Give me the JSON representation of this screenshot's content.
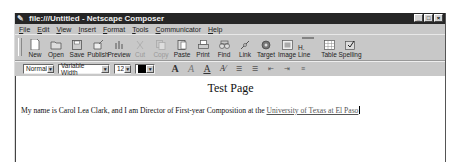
{
  "window": {
    "title": "file:///Untitled - Netscape Composer",
    "controls": [
      "minimize",
      "maximize",
      "close"
    ]
  },
  "menubar": {
    "items": [
      "File",
      "Edit",
      "View",
      "Insert",
      "Format",
      "Tools",
      "Communicator",
      "Help"
    ]
  },
  "toolbar": {
    "buttons": [
      {
        "label": "New",
        "icon": "new-page-icon",
        "enabled": true
      },
      {
        "label": "Open",
        "icon": "open-folder-icon",
        "enabled": true
      },
      {
        "label": "Save",
        "icon": "floppy-disk-icon",
        "enabled": true
      },
      {
        "label": "Publish",
        "icon": "publish-icon",
        "enabled": true
      },
      {
        "label": "Preview",
        "icon": "preview-icon",
        "enabled": true
      },
      {
        "label": "Cut",
        "icon": "scissors-icon",
        "enabled": false
      },
      {
        "label": "Copy",
        "icon": "copy-icon",
        "enabled": false
      },
      {
        "label": "Paste",
        "icon": "clipboard-icon",
        "enabled": true
      },
      {
        "label": "Print",
        "icon": "printer-icon",
        "enabled": true
      },
      {
        "label": "Find",
        "icon": "binoculars-icon",
        "enabled": true
      },
      {
        "label": "Link",
        "icon": "link-icon",
        "enabled": true
      },
      {
        "label": "Target",
        "icon": "target-icon",
        "enabled": true
      },
      {
        "label": "Image",
        "icon": "image-icon",
        "enabled": true
      },
      {
        "label": "H. Line",
        "icon": "horizontal-line-icon",
        "enabled": true
      },
      {
        "label": "Table",
        "icon": "table-icon",
        "enabled": true
      },
      {
        "label": "Spelling",
        "icon": "spelling-icon",
        "enabled": true
      }
    ]
  },
  "formatbar": {
    "paragraph_style": "Normal",
    "font": "Variable Width",
    "font_size": "12",
    "text_color": "#000000",
    "buttons": [
      {
        "name": "bigger-font",
        "glyph": "A"
      },
      {
        "name": "italic",
        "glyph": "A"
      },
      {
        "name": "underline",
        "glyph": "A"
      },
      {
        "name": "clear-styles",
        "glyph": "A⁄"
      },
      {
        "name": "bulleted-list",
        "glyph": "☰"
      },
      {
        "name": "numbered-list",
        "glyph": "☰"
      },
      {
        "name": "decrease-indent",
        "glyph": "⇤"
      },
      {
        "name": "increase-indent",
        "glyph": "⇥"
      },
      {
        "name": "alignment",
        "glyph": "≡"
      }
    ]
  },
  "document": {
    "heading": "Test Page",
    "paragraph_text": "My name is Carol Lea Clark, and I am Director of First-year Composition at the ",
    "link_text": "University of Texas at El Paso"
  }
}
